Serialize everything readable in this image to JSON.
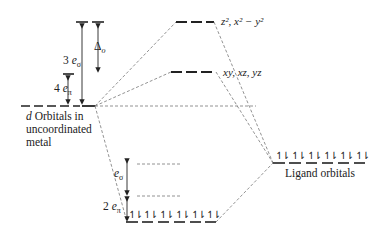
{
  "diagram": {
    "type": "molecular-orbital-energy-level",
    "levels": {
      "metal_d": {
        "label_lines": [
          "d Orbitals in",
          "uncoordinated",
          "metal"
        ],
        "label_first_word_italic": "d"
      },
      "eg": {
        "label": "z², x² − y²"
      },
      "t2g": {
        "label": "xy, xz, yz"
      },
      "ligand": {
        "label": "Ligand orbitals",
        "electron_pairs": 6
      },
      "bonding": {
        "electron_pairs": 6
      }
    },
    "annotations": {
      "three_e_sigma": {
        "coef": "3",
        "sym": "e",
        "sub": "σ"
      },
      "delta_o": {
        "sym": "Δ",
        "sub": "o"
      },
      "four_e_pi": {
        "coef": "4",
        "sym": "e",
        "sub": "π"
      },
      "e_sigma": {
        "sym": "e",
        "sub": "σ"
      },
      "two_e_pi": {
        "coef": "2",
        "sym": "e",
        "sub": "π"
      }
    },
    "electron_pair_glyph": "↿⇂",
    "colors": {
      "line": "#222222",
      "dashed": "#777777",
      "background": "#ffffff"
    }
  }
}
